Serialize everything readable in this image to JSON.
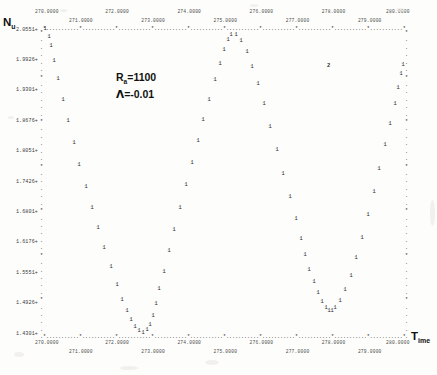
{
  "figure": {
    "kind": "ascii-line-printer-plot",
    "y_axis_title": "Nu",
    "y_axis_title_sub": "u",
    "x_axis_title": "Time",
    "x_axis_title_sub": "ime",
    "marker_symbol": "1",
    "overlap_symbol": "2",
    "frame_symbol": "*",
    "fill_symbol": "."
  },
  "annotation": {
    "line1_base": "R",
    "line1_sub": "a",
    "line1_rest": "=1100",
    "line2_symbol": "Λ",
    "line2_rest": "=-0.01"
  },
  "chart_data": {
    "type": "scatter",
    "title": "",
    "subtitle": "",
    "xlabel": "Time",
    "ylabel": "Nu",
    "grid": false,
    "legend": "none",
    "annotations": [
      "Ra=1100",
      "Λ=-0.01"
    ],
    "xlim": [
      270.0,
      280.0
    ],
    "ylim": [
      1.4301,
      2.0551
    ],
    "x_ticks_top": [
      "270.0000",
      "271.0000",
      "272.0000",
      "273.0000",
      "274.0000",
      "275.0000",
      "276.0000",
      "277.0000",
      "278.0000",
      "279.0000",
      "280.0000"
    ],
    "x_ticks_bottom": [
      "270.0000",
      "271.0000",
      "272.0000",
      "273.0000",
      "274.0000",
      "275.0000",
      "276.0000",
      "277.0000",
      "278.0000",
      "279.0000",
      "280.0000"
    ],
    "y_ticks": [
      "2.0551",
      "1.9926",
      "1.9301",
      "1.8676",
      "1.8051",
      "1.7426",
      "1.6801",
      "1.6176",
      "1.5551",
      "1.4926",
      "1.4301"
    ],
    "series": [
      {
        "name": "Nu(t)",
        "x": [
          270.05,
          270.18,
          270.22,
          270.3,
          270.42,
          270.55,
          270.7,
          270.85,
          271.0,
          271.18,
          271.35,
          271.52,
          271.7,
          271.88,
          272.05,
          272.2,
          272.32,
          272.44,
          272.55,
          272.66,
          272.78,
          272.88,
          272.96,
          273.04,
          273.12,
          273.22,
          273.34,
          273.48,
          273.64,
          273.8,
          273.96,
          274.12,
          274.28,
          274.44,
          274.6,
          274.76,
          274.9,
          275.02,
          275.12,
          275.22,
          275.34,
          275.48,
          275.64,
          275.8,
          275.96,
          276.12,
          276.3,
          276.48,
          276.66,
          276.84,
          277.0,
          277.14,
          277.26,
          277.38,
          277.5,
          277.62,
          277.74,
          277.84,
          277.92,
          278.0,
          278.1,
          278.22,
          278.36,
          278.52,
          278.68,
          278.84,
          279.0,
          279.16,
          279.32,
          279.48,
          279.62,
          279.74,
          279.84,
          279.92,
          279.97
        ],
        "y": [
          2.0551,
          2.038,
          2.02,
          1.99,
          1.952,
          1.91,
          1.866,
          1.82,
          1.776,
          1.73,
          1.688,
          1.645,
          1.605,
          1.565,
          1.528,
          1.498,
          1.476,
          1.456,
          1.443,
          1.434,
          1.4301,
          1.436,
          1.447,
          1.466,
          1.49,
          1.52,
          1.556,
          1.598,
          1.642,
          1.688,
          1.734,
          1.78,
          1.824,
          1.868,
          1.91,
          1.95,
          1.984,
          2.012,
          2.032,
          2.043,
          2.042,
          2.03,
          2.008,
          1.978,
          1.942,
          1.9,
          1.854,
          1.806,
          1.758,
          1.71,
          1.664,
          1.624,
          1.59,
          1.56,
          1.534,
          1.512,
          1.494,
          1.482,
          1.476,
          1.476,
          1.482,
          1.496,
          1.518,
          1.548,
          1.584,
          1.626,
          1.672,
          1.72,
          1.768,
          1.816,
          1.86,
          1.9,
          1.934,
          1.962,
          1.982
        ]
      }
    ]
  }
}
